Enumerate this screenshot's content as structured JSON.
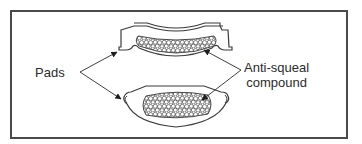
{
  "figure": {
    "labels": {
      "pads": "Pads",
      "compound_line1": "Anti-squeal",
      "compound_line2": "compound"
    },
    "parts": [
      {
        "id": "upper-pad",
        "type": "curved brake pad (backing plate with friction lining)"
      },
      {
        "id": "lower-pad",
        "type": "brake pad (friction side)"
      }
    ],
    "callouts": [
      {
        "label": "Pads",
        "targets": [
          "upper-pad",
          "lower-pad"
        ]
      },
      {
        "label": "Anti-squeal compound",
        "targets": [
          "upper-pad compound",
          "lower-pad compound"
        ]
      }
    ],
    "colors": {
      "line": "#3a3a3a",
      "frame": "#4a4a4a",
      "background": "#ffffff"
    }
  }
}
